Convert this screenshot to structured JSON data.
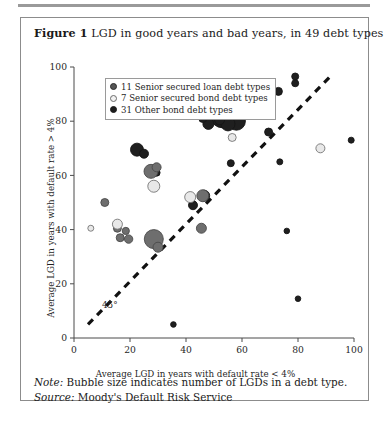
{
  "figure": {
    "number_label": "Figure 1",
    "title": "LGD in good years and bad years, in 49 debt types",
    "note_label": "Note:",
    "note_text": "Bubble size indicates number of LGDs in a debt type.",
    "source_label": "Source:",
    "source_text": "Moody's Default Risk Service"
  },
  "legend": {
    "items": [
      {
        "key": "loan",
        "label": "11 Senior secured loan debt types",
        "color": "#555555"
      },
      {
        "key": "srbond",
        "label": "7 Senior secured bond debt types",
        "color": "#f2f2f2"
      },
      {
        "key": "other",
        "label": "31 Other bond debt types",
        "color": "#1c1c1c"
      }
    ]
  },
  "chart_data": {
    "type": "scatter",
    "title": "LGD in good years and bad years, in 49 debt types",
    "xlabel": "Average LGD in years with default rate < 4%",
    "ylabel": "Average LGD in years with default rate > 4%",
    "xlim": [
      0,
      100
    ],
    "ylim": [
      0,
      100
    ],
    "xticks": [
      0,
      20,
      40,
      60,
      80,
      100
    ],
    "yticks": [
      0,
      20,
      40,
      60,
      80,
      100
    ],
    "grid": false,
    "legend_position": "top-left",
    "annotations": [
      {
        "text": "45°",
        "x": 10,
        "y": 11,
        "kind": "reference-line-label"
      }
    ],
    "reference_line": {
      "label": "45°",
      "style": "dashed",
      "from": [
        5,
        5
      ],
      "to": [
        92,
        97
      ]
    },
    "size_encoding": "Bubble size indicates number of LGDs in a debt type.",
    "series": [
      {
        "name": "11 Senior secured loan debt types",
        "color": "#6e6e6e",
        "edge": "#4a4a4a",
        "points": [
          {
            "x": 15.5,
            "y": 40.5,
            "r": 4.0
          },
          {
            "x": 18.5,
            "y": 39.5,
            "r": 3.6
          },
          {
            "x": 16.5,
            "y": 37.0,
            "r": 4.0
          },
          {
            "x": 19.5,
            "y": 36.5,
            "r": 4.2
          },
          {
            "x": 28.5,
            "y": 36.5,
            "r": 9.5
          },
          {
            "x": 30.0,
            "y": 33.5,
            "r": 5.0
          },
          {
            "x": 45.5,
            "y": 40.5,
            "r": 5.0
          },
          {
            "x": 11.0,
            "y": 50.0,
            "r": 4.0
          },
          {
            "x": 27.5,
            "y": 61.5,
            "r": 7.0
          },
          {
            "x": 29.5,
            "y": 63.0,
            "r": 4.5
          },
          {
            "x": 46.0,
            "y": 52.5,
            "r": 6.0
          }
        ]
      },
      {
        "name": "7 Senior secured bond debt types",
        "color": "#e8e8e8",
        "edge": "#757575",
        "points": [
          {
            "x": 26.5,
            "y": 88.0,
            "r": 3.0
          },
          {
            "x": 28.5,
            "y": 56.0,
            "r": 6.0
          },
          {
            "x": 41.5,
            "y": 52.0,
            "r": 5.5
          },
          {
            "x": 6.0,
            "y": 40.5,
            "r": 3.0
          },
          {
            "x": 15.5,
            "y": 42.0,
            "r": 5.0
          },
          {
            "x": 56.5,
            "y": 74.0,
            "r": 4.0
          },
          {
            "x": 88.0,
            "y": 70.0,
            "r": 4.5
          }
        ]
      },
      {
        "name": "31 Other bond debt types",
        "color": "#1f1f1f",
        "edge": "#151515",
        "points": [
          {
            "x": 13.0,
            "y": 89.5,
            "r": 3.0
          },
          {
            "x": 44.5,
            "y": 86.5,
            "r": 10.0
          },
          {
            "x": 49.0,
            "y": 84.5,
            "r": 13.0
          },
          {
            "x": 53.5,
            "y": 83.0,
            "r": 15.0
          },
          {
            "x": 57.5,
            "y": 83.5,
            "r": 11.0
          },
          {
            "x": 60.0,
            "y": 85.0,
            "r": 8.0
          },
          {
            "x": 58.0,
            "y": 80.0,
            "r": 9.0
          },
          {
            "x": 55.0,
            "y": 79.0,
            "r": 7.0
          },
          {
            "x": 52.0,
            "y": 80.5,
            "r": 5.0
          },
          {
            "x": 56.0,
            "y": 82.0,
            "r": 4.0
          },
          {
            "x": 62.5,
            "y": 84.0,
            "r": 6.5
          },
          {
            "x": 64.5,
            "y": 86.0,
            "r": 4.5
          },
          {
            "x": 62.0,
            "y": 90.5,
            "r": 4.5
          },
          {
            "x": 66.0,
            "y": 82.5,
            "r": 5.0
          },
          {
            "x": 48.0,
            "y": 79.0,
            "r": 5.5
          },
          {
            "x": 46.0,
            "y": 81.0,
            "r": 4.0
          },
          {
            "x": 73.0,
            "y": 91.0,
            "r": 4.0
          },
          {
            "x": 79.0,
            "y": 96.5,
            "r": 3.5
          },
          {
            "x": 79.0,
            "y": 94.0,
            "r": 3.5
          },
          {
            "x": 69.5,
            "y": 76.0,
            "r": 4.0
          },
          {
            "x": 73.5,
            "y": 65.0,
            "r": 3.0
          },
          {
            "x": 99.0,
            "y": 73.0,
            "r": 3.0
          },
          {
            "x": 56.0,
            "y": 64.5,
            "r": 3.5
          },
          {
            "x": 46.5,
            "y": 52.5,
            "r": 5.5
          },
          {
            "x": 42.5,
            "y": 49.0,
            "r": 4.5
          },
          {
            "x": 29.5,
            "y": 61.0,
            "r": 3.5
          },
          {
            "x": 22.5,
            "y": 69.5,
            "r": 6.5
          },
          {
            "x": 25.0,
            "y": 68.0,
            "r": 4.5
          },
          {
            "x": 35.5,
            "y": 5.0,
            "r": 2.8
          },
          {
            "x": 76.0,
            "y": 39.5,
            "r": 2.8
          },
          {
            "x": 80.0,
            "y": 14.5,
            "r": 2.8
          }
        ]
      }
    ]
  },
  "axes": {
    "x_tick_labels": [
      "0",
      "20",
      "40",
      "60",
      "80",
      "100"
    ],
    "y_tick_labels": [
      "0",
      "20",
      "40",
      "60",
      "80",
      "100"
    ],
    "x_title": "Average LGD in years with default rate < 4%",
    "y_title": "Average LGD in years with default rate > 4%"
  }
}
